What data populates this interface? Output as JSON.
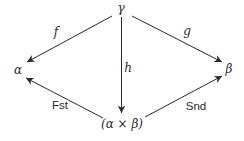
{
  "diagram": {
    "kind": "commutative-diagram",
    "colors": {
      "ink": "#2b2b2b",
      "background": "#ffffff"
    },
    "nodes": {
      "gamma": {
        "label": "γ",
        "pos": {
          "x": 121,
          "y": 8
        }
      },
      "alpha": {
        "label": "α",
        "pos": {
          "x": 18,
          "y": 70
        }
      },
      "beta": {
        "label": "β",
        "pos": {
          "x": 229,
          "y": 69
        }
      },
      "product": {
        "label": "(α × β)",
        "pos": {
          "x": 122,
          "y": 124
        }
      }
    },
    "edges": {
      "f": {
        "label": "f",
        "from": "gamma",
        "to": "alpha",
        "line": {
          "x1": 112,
          "y1": 16,
          "x2": 27,
          "y2": 62
        },
        "label_pos": {
          "x": 56,
          "y": 32
        }
      },
      "g": {
        "label": "g",
        "from": "gamma",
        "to": "beta",
        "line": {
          "x1": 132,
          "y1": 16,
          "x2": 222,
          "y2": 62
        },
        "label_pos": {
          "x": 187,
          "y": 31
        }
      },
      "h": {
        "label": "h",
        "from": "gamma",
        "to": "product",
        "line": {
          "x1": 121.5,
          "y1": 17,
          "x2": 121.5,
          "y2": 113
        },
        "label_pos": {
          "x": 128,
          "y": 68
        }
      },
      "fst": {
        "label": "Fst",
        "from": "product",
        "to": "alpha",
        "line": {
          "x1": 103,
          "y1": 118,
          "x2": 26,
          "y2": 78
        },
        "label_pos": {
          "x": 60,
          "y": 106
        }
      },
      "snd": {
        "label": "Snd",
        "from": "product",
        "to": "beta",
        "line": {
          "x1": 145,
          "y1": 117,
          "x2": 222,
          "y2": 76
        },
        "label_pos": {
          "x": 196,
          "y": 107
        }
      }
    }
  }
}
